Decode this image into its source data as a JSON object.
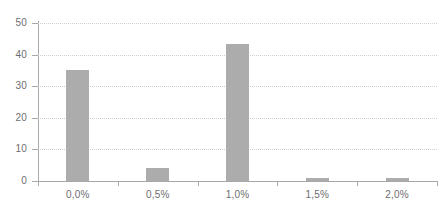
{
  "chart_data": {
    "type": "bar",
    "title": "",
    "subtitle": "",
    "xlabel": "",
    "ylabel": "",
    "categories": [
      "0,0%",
      "0,5%",
      "1,0%",
      "1,5%",
      "2,0%"
    ],
    "values": [
      35,
      4,
      43.5,
      1,
      1
    ],
    "ylim": [
      0,
      50
    ],
    "yticks": [
      0,
      10,
      20,
      30,
      40,
      50
    ],
    "ytick_labels": [
      "0",
      "10",
      "20",
      "30",
      "40",
      "50"
    ],
    "grid": "horizontal-dotted",
    "legend": "none",
    "series": [
      {
        "name": "",
        "values": [
          35,
          4,
          43.5,
          1,
          1
        ]
      }
    ],
    "colors": {
      "bar": "#acacac",
      "axis": "#a8a8ac",
      "gridline": "#cfcfd4",
      "tick_label": "#6d6d70",
      "background": "#ffffff"
    }
  }
}
